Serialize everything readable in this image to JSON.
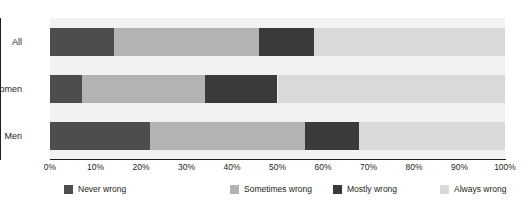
{
  "chart_data": {
    "type": "bar",
    "orientation": "horizontal",
    "stacked": true,
    "stack_total": 100,
    "title": "",
    "xlabel": "",
    "ylabel": "",
    "xlim": [
      0,
      100
    ],
    "grid": false,
    "legend_position": "bottom",
    "categories": [
      "All",
      "Women",
      "Men"
    ],
    "xticks": [
      "0%",
      "10%",
      "20%",
      "30%",
      "40%",
      "50%",
      "60%",
      "70%",
      "80%",
      "90%",
      "100%"
    ],
    "xtick_values": [
      0,
      10,
      20,
      30,
      40,
      50,
      60,
      70,
      80,
      90,
      100
    ],
    "series": [
      {
        "name": "Never wrong",
        "color": "#4d4d4d",
        "values": [
          14,
          7,
          22
        ]
      },
      {
        "name": "Sometimes wrong",
        "color": "#b3b3b3",
        "values": [
          32,
          27,
          34
        ]
      },
      {
        "name": "Mostly wrong",
        "color": "#3a3a3a",
        "values": [
          12,
          16,
          12
        ]
      },
      {
        "name": "Always wrong",
        "color": "#d9d9d9",
        "values": [
          42,
          50,
          32
        ]
      }
    ],
    "plot_background": "#f2f2f2",
    "axis_color": "#231f20"
  }
}
